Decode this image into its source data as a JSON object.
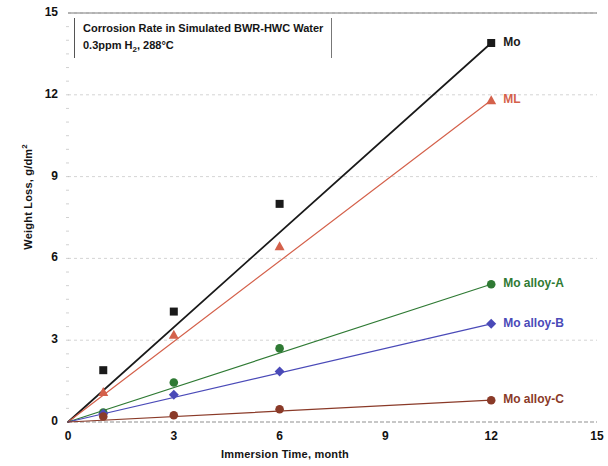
{
  "chart_data": {
    "type": "line",
    "title": "",
    "xlabel": "Immersion Time, month",
    "ylabel": "Weight Loss, g/dm²",
    "ylabel_main": "Weight Loss, g/dm",
    "ylabel_sup": "2",
    "xlim": [
      0,
      15
    ],
    "ylim": [
      0,
      15
    ],
    "xticks": [
      "0",
      "3",
      "6",
      "9",
      "12",
      "15"
    ],
    "yticks": [
      "0",
      "3",
      "6",
      "9",
      "12",
      "15"
    ],
    "grid": true,
    "legend_position": "right-inline",
    "annotation": {
      "line1_a": "Corrosion Rate  in Simulated BWR-HWC Water",
      "line2_a": "0.3ppm H",
      "line2_sub": "2",
      "line2_b": ", 288°C"
    },
    "series": [
      {
        "name": "Mo",
        "color": "#1a1a1a",
        "marker": "square",
        "x": [
          0,
          1,
          3,
          6,
          12
        ],
        "values": [
          0,
          1.9,
          4.05,
          8.0,
          13.9
        ],
        "label_x": 12,
        "label_y": 13.9
      },
      {
        "name": "ML",
        "color": "#d4614b",
        "marker": "triangle",
        "x": [
          0,
          1,
          3,
          6,
          12
        ],
        "values": [
          0,
          1.1,
          3.2,
          6.45,
          11.8
        ],
        "label_x": 12,
        "label_y": 11.8
      },
      {
        "name": "Mo alloy-A",
        "color": "#2f7a34",
        "marker": "circle",
        "x": [
          0,
          1,
          3,
          6,
          12
        ],
        "values": [
          0,
          0.35,
          1.45,
          2.7,
          5.05
        ],
        "label_x": 12,
        "label_y": 5.05
      },
      {
        "name": "Mo alloy-B",
        "color": "#4a4ab8",
        "marker": "diamond",
        "x": [
          0,
          1,
          3,
          6,
          12
        ],
        "values": [
          0,
          0.3,
          1.0,
          1.85,
          3.6
        ],
        "label_x": 12,
        "label_y": 3.6
      },
      {
        "name": "Mo alloy-C",
        "color": "#8a3a28",
        "marker": "circle",
        "x": [
          0,
          1,
          3,
          6,
          12
        ],
        "values": [
          0,
          0.2,
          0.25,
          0.47,
          0.8
        ],
        "label_x": 12,
        "label_y": 0.8
      }
    ]
  }
}
